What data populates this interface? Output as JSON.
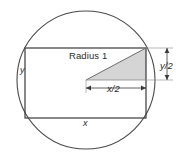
{
  "figure": {
    "type": "geometry-diagram",
    "background_color": "#ffffff",
    "stroke_color": "#3a3a3a",
    "shade_color": "#d5d5d5",
    "labels": {
      "radius": "Radius 1",
      "half_height": "y/2",
      "half_width": "x/2",
      "height": "y",
      "width": "x"
    },
    "shapes": {
      "circle": {
        "cx": 86,
        "cy": 80,
        "r": 69
      },
      "rectangle": {
        "x": 25,
        "y": 48,
        "width": 121,
        "height": 70
      },
      "triangle": {
        "vertices": [
          [
            86,
            80
          ],
          [
            146,
            80
          ],
          [
            146,
            48
          ]
        ],
        "description": "shaded right triangle with legs x/2 and y/2 and hypotenuse equal to the radius"
      }
    },
    "dimension_lines": {
      "x_half": {
        "from": [
          86,
          88
        ],
        "to": [
          146,
          88
        ],
        "arrows": "both"
      },
      "y_half": {
        "from": [
          167,
          48
        ],
        "to": [
          167,
          80
        ],
        "arrows": "both"
      }
    }
  }
}
